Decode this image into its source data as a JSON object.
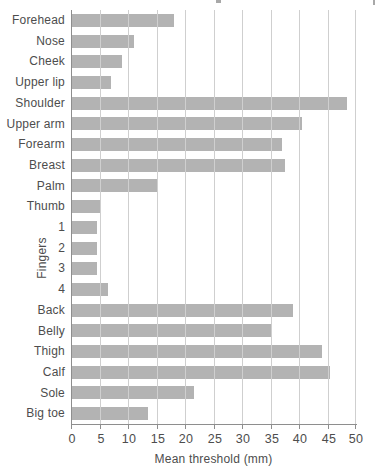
{
  "chart_data": {
    "type": "bar",
    "orientation": "horizontal",
    "title": "",
    "xlabel": "Mean threshold (mm)",
    "ylabel": "",
    "xlim": [
      0,
      50
    ],
    "xticks": [
      0,
      5,
      10,
      15,
      20,
      25,
      30,
      35,
      40,
      45,
      50
    ],
    "grid": true,
    "legend": false,
    "categories": [
      "Forehead",
      "Nose",
      "Cheek",
      "Upper lip",
      "Shoulder",
      "Upper arm",
      "Forearm",
      "Breast",
      "Palm",
      "Thumb",
      "1",
      "2",
      "3",
      "4",
      "Back",
      "Belly",
      "Thigh",
      "Calf",
      "Sole",
      "Big toe"
    ],
    "values": [
      18,
      11,
      9,
      7,
      48.5,
      40.5,
      37,
      37.5,
      15,
      5,
      4.5,
      4.5,
      4.5,
      6.5,
      39,
      35,
      44,
      45.5,
      21.5,
      13.5
    ],
    "group_label": "Fingers",
    "group_categories": [
      "1",
      "2",
      "3",
      "4"
    ],
    "colors": {
      "bar": "#b3b3b3",
      "gridline": "#cfcfcf",
      "axis": "#8e8e8e",
      "text": "#4d4d4d",
      "background": "#ffffff"
    }
  }
}
